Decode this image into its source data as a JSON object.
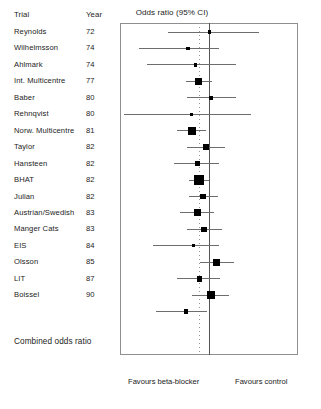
{
  "columns": {
    "trial_header": "Trial",
    "year_header": "Year",
    "plot_title": "Odds ratio (95% CI)"
  },
  "summary_row_label": "Combined odds ratio",
  "axis": {
    "tick_labels": [
      "0.1",
      "0.78",
      "10"
    ],
    "min": 0.1,
    "max": 10,
    "null_value": 1,
    "pooled_value": 0.78,
    "minor_ticks": [
      0.2,
      0.3,
      0.4,
      0.5,
      0.6,
      0.7,
      0.8,
      0.9,
      2,
      3,
      4,
      5,
      6,
      7,
      8,
      9
    ],
    "left_footer": "Favours beta-blocker",
    "right_footer": "Favours control"
  },
  "colors": {
    "marker": "#000000",
    "ci_line": "#6d6d6d",
    "null_line": "#555555",
    "pooled_line": "#9a9a9a",
    "frame": "#8f8f8f",
    "text": "#1c1c1c"
  },
  "chart_data": {
    "type": "forest",
    "title": "Odds ratio (95% CI)",
    "xlabel": "",
    "ylabel": "",
    "xscale": "log",
    "xlim": [
      0.1,
      10
    ],
    "grid": false,
    "legend": "none",
    "reference_line": 1,
    "pooled_line": 0.78,
    "xticks": [
      0.1,
      0.78,
      10
    ],
    "xticklabels": [
      "0.1",
      "0.78",
      "10"
    ],
    "left_footer": "Favours beta-blocker",
    "right_footer": "Favours control",
    "columns": [
      "Trial",
      "Year",
      "Odds ratio (95% CI)"
    ],
    "rows": [
      {
        "trial": "Reynolds",
        "year": "72",
        "or": 1.02,
        "lo": 0.34,
        "hi": 3.7,
        "size": 1
      },
      {
        "trial": "Wilhelmsson",
        "year": "74",
        "or": 0.58,
        "lo": 0.16,
        "hi": 1.3,
        "size": 1
      },
      {
        "trial": "Ahlmark",
        "year": "74",
        "or": 0.7,
        "lo": 0.2,
        "hi": 2.0,
        "size": 1
      },
      {
        "trial": "Int. Multicentre",
        "year": "77",
        "or": 0.77,
        "lo": 0.55,
        "hi": 1.08,
        "size": 4
      },
      {
        "trial": "Baber",
        "year": "80",
        "or": 1.05,
        "lo": 0.56,
        "hi": 2.0,
        "size": 2
      },
      {
        "trial": "Rehnqvist",
        "year": "80",
        "or": 0.63,
        "lo": 0.11,
        "hi": 3.0,
        "size": 1
      },
      {
        "trial": "Norw. Multicentre",
        "year": "81",
        "or": 0.64,
        "lo": 0.44,
        "hi": 0.93,
        "size": 5
      },
      {
        "trial": "Taylor",
        "year": "82",
        "or": 0.92,
        "lo": 0.56,
        "hi": 1.52,
        "size": 3
      },
      {
        "trial": "Hansteen",
        "year": "82",
        "or": 0.74,
        "lo": 0.4,
        "hi": 1.3,
        "size": 2
      },
      {
        "trial": "BHAT",
        "year": "82",
        "or": 0.77,
        "lo": 0.6,
        "hi": 1.0,
        "size": 6
      },
      {
        "trial": "Julian",
        "year": "82",
        "or": 0.85,
        "lo": 0.6,
        "hi": 1.25,
        "size": 3
      },
      {
        "trial": "Austrian/Swedish",
        "year": "83",
        "or": 0.74,
        "lo": 0.47,
        "hi": 1.15,
        "size": 4
      },
      {
        "trial": "Manger Cats",
        "year": "83",
        "or": 0.88,
        "lo": 0.56,
        "hi": 1.4,
        "size": 3
      },
      {
        "trial": "EIS",
        "year": "84",
        "or": 0.67,
        "lo": 0.23,
        "hi": 1.3,
        "size": 1
      },
      {
        "trial": "Olsson",
        "year": "85",
        "or": 1.2,
        "lo": 0.8,
        "hi": 1.9,
        "size": 4
      },
      {
        "trial": "LIT",
        "year": "87",
        "or": 0.78,
        "lo": 0.44,
        "hi": 1.32,
        "size": 3
      },
      {
        "trial": "Boissel",
        "year": "90",
        "or": 1.05,
        "lo": 0.64,
        "hi": 1.7,
        "size": 5
      },
      {
        "trial": "Boissel ",
        "year": "90",
        "or": 0.55,
        "lo": 0.25,
        "hi": 0.95,
        "size": 2
      }
    ],
    "summary": {
      "label": "Combined odds ratio",
      "or": 0.78,
      "lo": 0.7,
      "hi": 0.87
    }
  }
}
